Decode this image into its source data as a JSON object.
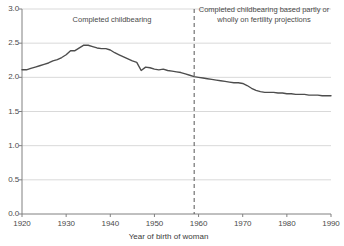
{
  "chart_data": {
    "type": "line",
    "title": "",
    "subtitle": "",
    "xlabel": "Year of birth of woman",
    "ylabel": "",
    "xlim": [
      1920,
      1990
    ],
    "ylim": [
      0.0,
      3.0
    ],
    "xticks": [
      "1920",
      "1930",
      "1940",
      "1950",
      "1960",
      "1970",
      "1980",
      "1990"
    ],
    "yticks": [
      "0.0",
      "0.5",
      "1.0",
      "1.5",
      "2.0",
      "2.5",
      "3.0"
    ],
    "grid": "horizontal",
    "legend": "none",
    "line_color": "#4d4d4d",
    "grid_color": "#d9d9d9",
    "axis_color": "#808080",
    "annotations": [
      {
        "name": "completed-childbearing-label",
        "text": "Completed childbearing",
        "x": 1936,
        "y": 2.78
      },
      {
        "name": "projected-childbearing-label",
        "text": "Completed childbearing based partly or wholly on fertility projections",
        "x": 1975,
        "y": 2.88
      }
    ],
    "marker_lines": [
      {
        "name": "projection-divider",
        "orientation": "vertical",
        "x": 1959,
        "style": "dashed",
        "color": "#555555"
      }
    ],
    "series": [
      {
        "name": "Completed family size",
        "x": [
          1920,
          1921,
          1922,
          1923,
          1924,
          1925,
          1926,
          1927,
          1928,
          1929,
          1930,
          1931,
          1932,
          1933,
          1934,
          1935,
          1936,
          1937,
          1938,
          1939,
          1940,
          1941,
          1942,
          1943,
          1944,
          1945,
          1946,
          1947,
          1948,
          1949,
          1950,
          1951,
          1952,
          1953,
          1954,
          1955,
          1956,
          1957,
          1958,
          1959,
          1960,
          1961,
          1962,
          1963,
          1964,
          1965,
          1966,
          1967,
          1968,
          1969,
          1970,
          1971,
          1972,
          1973,
          1974,
          1975,
          1976,
          1977,
          1978,
          1979,
          1980,
          1981,
          1982,
          1983,
          1984,
          1985,
          1986,
          1987,
          1988,
          1989,
          1990
        ],
        "values": [
          2.11,
          2.11,
          2.13,
          2.15,
          2.17,
          2.19,
          2.21,
          2.24,
          2.26,
          2.29,
          2.33,
          2.39,
          2.39,
          2.43,
          2.47,
          2.47,
          2.45,
          2.43,
          2.42,
          2.42,
          2.4,
          2.36,
          2.33,
          2.3,
          2.27,
          2.24,
          2.22,
          2.1,
          2.15,
          2.14,
          2.12,
          2.11,
          2.12,
          2.1,
          2.09,
          2.08,
          2.07,
          2.05,
          2.03,
          2.01,
          2.0,
          1.99,
          1.98,
          1.97,
          1.96,
          1.95,
          1.94,
          1.93,
          1.92,
          1.92,
          1.91,
          1.88,
          1.84,
          1.81,
          1.79,
          1.78,
          1.78,
          1.78,
          1.77,
          1.77,
          1.76,
          1.76,
          1.75,
          1.75,
          1.75,
          1.74,
          1.74,
          1.74,
          1.73,
          1.73,
          1.73
        ]
      }
    ]
  }
}
